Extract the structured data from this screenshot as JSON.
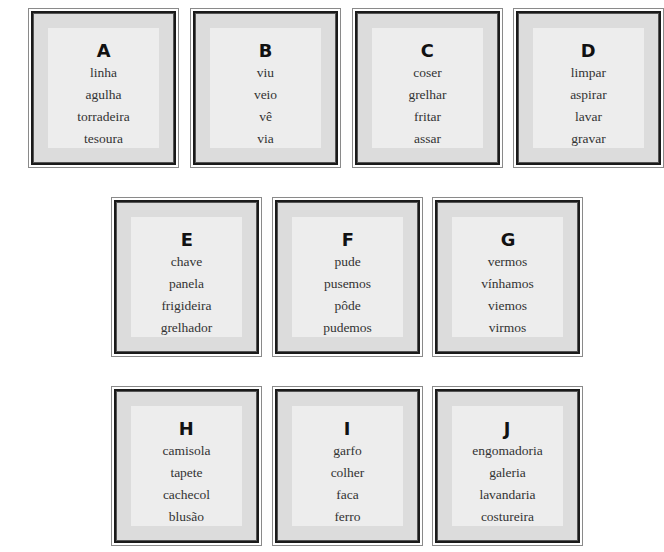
{
  "cards": [
    {
      "letter": "A",
      "words": [
        "linha",
        "agulha",
        "torradeira",
        "tesoura"
      ]
    },
    {
      "letter": "B",
      "words": [
        "viu",
        "veio",
        "vê",
        "via"
      ]
    },
    {
      "letter": "C",
      "words": [
        "coser",
        "grelhar",
        "fritar",
        "assar"
      ]
    },
    {
      "letter": "D",
      "words": [
        "limpar",
        "aspirar",
        "lavar",
        "gravar"
      ]
    },
    {
      "letter": "E",
      "words": [
        "chave",
        "panela",
        "frigideira",
        "grelhador"
      ]
    },
    {
      "letter": "F",
      "words": [
        "pude",
        "pusemos",
        "pôde",
        "pudemos"
      ]
    },
    {
      "letter": "G",
      "words": [
        "vermos",
        "vínhamos",
        "viemos",
        "virmos"
      ]
    },
    {
      "letter": "H",
      "words": [
        "camisola",
        "tapete",
        "cachecol",
        "blusão"
      ]
    },
    {
      "letter": "I",
      "words": [
        "garfo",
        "colher",
        "faca",
        "ferro"
      ]
    },
    {
      "letter": "J",
      "words": [
        "engomadoria",
        "galeria",
        "lavandaria",
        "costureira"
      ]
    }
  ],
  "colors": {
    "frame": "#1a1a1a",
    "band": "#dcdcdc",
    "panel": "#ededed",
    "text": "#333333"
  }
}
